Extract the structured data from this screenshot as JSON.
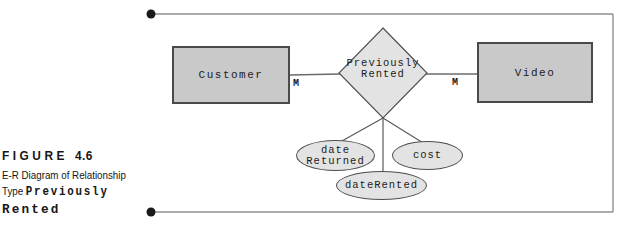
{
  "figure_caption": {
    "label": "FIGURE",
    "number": "4.6",
    "line1": "E-R Diagram of Relationship",
    "line2_text": "Type",
    "line2_code": "Previously",
    "line3_code": "Rented"
  },
  "diagram": {
    "entity_left": "Customer",
    "entity_right": "Video",
    "relationship_line1": "Previously",
    "relationship_line2": "Rented",
    "cardinality_left": "M",
    "cardinality_right": "M",
    "attribute1_line1": "date",
    "attribute1_line2": "Returned",
    "attribute2": "cost",
    "attribute3": "dateRented",
    "colors": {
      "entity_fill": "#c9c9c9",
      "attribute_fill": "#e3e3e3",
      "shape_stroke": "#4f4f4f",
      "connector": "#6b6b6b",
      "frame_line": "#8f8f8f",
      "bullet": "#1a1a1a"
    }
  }
}
